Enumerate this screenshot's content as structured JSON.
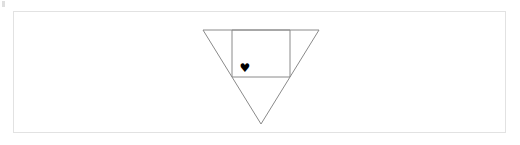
{
  "panel": {
    "background_color": "#ffffff",
    "border_color": "#e2e2e2"
  },
  "artifact": {
    "name": "corner-speck",
    "color": "#d9d9d9"
  },
  "figure": {
    "title": "",
    "stroke_color": "#8a8a8a",
    "stroke_width": 1,
    "shapes": [
      {
        "name": "inverted-triangle",
        "type": "triangle",
        "orientation": "point-down",
        "points": "203,30 319,30 261,124"
      },
      {
        "name": "inscribed-rectangle",
        "type": "rectangle",
        "points": "232,30 290,30 290,77 232,77"
      }
    ],
    "heart": {
      "glyph": "♥",
      "icon_name": "heart-icon",
      "color": "#000000",
      "x": 244,
      "y": 69
    }
  }
}
